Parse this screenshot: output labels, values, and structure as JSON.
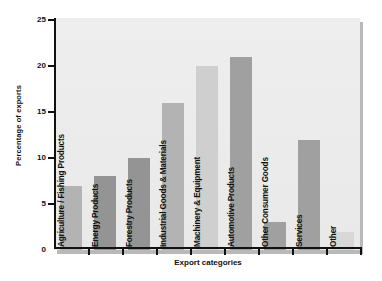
{
  "chart_data": {
    "type": "bar",
    "title": "",
    "xlabel": "Export categories",
    "ylabel": "Percentage of exports",
    "ylim": [
      0,
      25
    ],
    "yticks": [
      0,
      5,
      10,
      15,
      20,
      25
    ],
    "grid": false,
    "legend": "none",
    "categories": [
      "Agriculture / Fishing Products",
      "Energy Products",
      "Forestry Products",
      "Industrial Goods & Materials",
      "Machinery & Equipment",
      "Automotive Products",
      "Other Consumer Goods",
      "Services",
      "Other"
    ],
    "values": [
      7,
      8,
      10,
      16,
      20,
      21,
      3,
      12,
      2
    ],
    "bar_colors": [
      "#b3b3b3",
      "#949494",
      "#949494",
      "#b3b3b3",
      "#cfcfcf",
      "#a0a0a0",
      "#a0a0a0",
      "#a0a0a0",
      "#d8d8d8"
    ]
  },
  "style": {
    "plot_background": "#ececec",
    "axis_color": "#111111",
    "text_color": "#111111",
    "shadow_color": "#b9b9b9"
  }
}
